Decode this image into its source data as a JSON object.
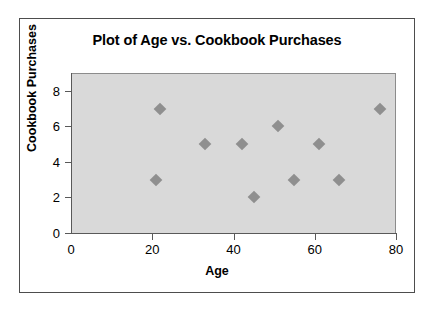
{
  "chart_data": {
    "type": "scatter",
    "title": "Plot of Age vs. Cookbook Purchases",
    "xlabel": "Age",
    "ylabel": "Cookbook Purchases",
    "xlim": [
      0,
      80
    ],
    "ylim": [
      0,
      9
    ],
    "xticks": [
      "0",
      "20",
      "40",
      "60",
      "80"
    ],
    "xtick_values": [
      0,
      20,
      40,
      60,
      80
    ],
    "yticks": [
      "0",
      "2",
      "4",
      "6",
      "8"
    ],
    "ytick_values": [
      0,
      2,
      4,
      6,
      8
    ],
    "grid": false,
    "legend": false,
    "marker_shape": "diamond",
    "marker_color": "#8f8f8f",
    "plot_background": "#d9d9d9",
    "points": [
      {
        "x": 21,
        "y": 3
      },
      {
        "x": 22,
        "y": 7
      },
      {
        "x": 33,
        "y": 5
      },
      {
        "x": 42,
        "y": 5
      },
      {
        "x": 45,
        "y": 2
      },
      {
        "x": 51,
        "y": 6
      },
      {
        "x": 55,
        "y": 3
      },
      {
        "x": 61,
        "y": 5
      },
      {
        "x": 66,
        "y": 3
      },
      {
        "x": 76,
        "y": 7
      }
    ]
  }
}
